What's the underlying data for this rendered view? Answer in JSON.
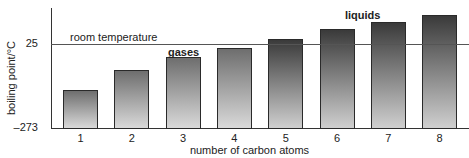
{
  "chart_data": {
    "type": "bar",
    "title": "",
    "xlabel": "number of carbon atoms",
    "ylabel": "boiling point/°C",
    "categories": [
      "1",
      "2",
      "3",
      "4",
      "5",
      "6",
      "7",
      "8"
    ],
    "values": [
      -137,
      -66,
      -20,
      11,
      43,
      78,
      103,
      128
    ],
    "ylim": [
      -273,
      150
    ],
    "yticks": [
      "25",
      "–273"
    ],
    "reference_line": {
      "label": "room temperature",
      "value": 25
    },
    "annotations": [
      "gases",
      "liquids"
    ],
    "groups": [
      {
        "name": "gases",
        "categories": [
          "1",
          "2",
          "3",
          "4"
        ]
      },
      {
        "name": "liquids",
        "categories": [
          "5",
          "6",
          "7",
          "8"
        ]
      }
    ],
    "grid": false,
    "legend": null
  },
  "labels": {
    "ylabel": "boiling point/°C",
    "xlabel": "number of carbon atoms",
    "ytick_top": "25",
    "ytick_bottom": "–273",
    "room_temperature": "room temperature",
    "gases": "gases",
    "liquids": "liquids"
  }
}
